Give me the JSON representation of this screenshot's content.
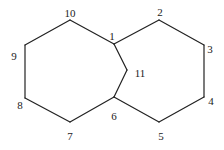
{
  "diagram": {
    "type": "bicyclic ring skeleton (numbered atoms)",
    "atoms": [
      {
        "id": "1",
        "label": "1",
        "x": 114,
        "y": 44,
        "lx": 112,
        "ly": 40
      },
      {
        "id": "2",
        "label": "2",
        "x": 159,
        "y": 20,
        "lx": 160,
        "ly": 16
      },
      {
        "id": "3",
        "label": "3",
        "x": 204,
        "y": 45,
        "lx": 210,
        "ly": 53
      },
      {
        "id": "4",
        "label": "4",
        "x": 204,
        "y": 97,
        "lx": 211,
        "ly": 105
      },
      {
        "id": "5",
        "label": "5",
        "x": 159,
        "y": 122,
        "lx": 161,
        "ly": 140
      },
      {
        "id": "6",
        "label": "6",
        "x": 114,
        "y": 97,
        "lx": 114,
        "ly": 120
      },
      {
        "id": "7",
        "label": "7",
        "x": 70,
        "y": 122,
        "lx": 70,
        "ly": 140
      },
      {
        "id": "8",
        "label": "8",
        "x": 25,
        "y": 98,
        "lx": 20,
        "ly": 109
      },
      {
        "id": "9",
        "label": "9",
        "x": 25,
        "y": 45,
        "lx": 14,
        "ly": 60
      },
      {
        "id": "10",
        "label": "10",
        "x": 70,
        "y": 20,
        "lx": 70,
        "ly": 17
      },
      {
        "id": "11",
        "label": "11",
        "x": 127,
        "y": 70,
        "lx": 140,
        "ly": 77
      }
    ],
    "bonds": [
      [
        "1",
        "2"
      ],
      [
        "2",
        "3"
      ],
      [
        "3",
        "4"
      ],
      [
        "4",
        "5"
      ],
      [
        "5",
        "6"
      ],
      [
        "6",
        "7"
      ],
      [
        "7",
        "8"
      ],
      [
        "8",
        "9"
      ],
      [
        "9",
        "10"
      ],
      [
        "10",
        "1"
      ],
      [
        "1",
        "11"
      ],
      [
        "11",
        "6"
      ]
    ]
  }
}
